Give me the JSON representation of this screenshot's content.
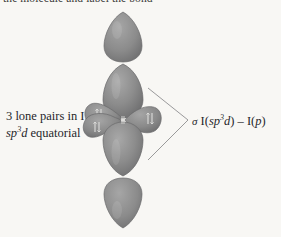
{
  "figure": {
    "name": "hybrid-orbital-diagram-iodine",
    "background_color": "#f8f7f4",
    "caption_top": "the molecule and label the bonds.",
    "labels": {
      "left_line1": "3 lone pairs in I",
      "left_line2_prefix": "sp",
      "left_line2_sup": "3",
      "left_line2_mid": "d",
      "left_line2_suffix": " equatorial",
      "right_sigma": "σ",
      "right_atom1": " I(",
      "right_hybrid_prefix": "sp",
      "right_hybrid_sup": "3",
      "right_hybrid_mid": "d",
      "right_close1": ") ",
      "right_dash": "–",
      "right_atom2": " I(",
      "right_porb": "p",
      "right_close2": ")"
    },
    "colors": {
      "lobe_fill": "#8c8c8c",
      "lobe_fill_light": "#9a9a9a",
      "lobe_fill_dark": "#6f6f70",
      "lobe_stroke": "#6a6a6b",
      "bracket_line": "#8f8f90",
      "text": "#26262a",
      "electron_mark": "#d8d8d6"
    },
    "geometry": {
      "center_x": 123,
      "center_y": 120,
      "axial_top_tip_y": 12,
      "axial_bottom_tip_y": 228,
      "bracket_apex_x": 188,
      "bracket_apex_y": 120,
      "bracket_top_x": 148,
      "bracket_top_y": 88,
      "bracket_bottom_x": 148,
      "bracket_bottom_y": 160
    },
    "orbital_lobes": [
      {
        "name": "axial-p-lobe-top-outer",
        "orientation": "up",
        "shape": "teardrop",
        "electrons": 0
      },
      {
        "name": "axial-hybrid-lobe-top",
        "orientation": "up",
        "shape": "ellipse",
        "electrons": 0
      },
      {
        "name": "equatorial-lobe-upper-left",
        "orientation": "upper-left",
        "shape": "lobe",
        "electrons": 2
      },
      {
        "name": "equatorial-lobe-lower-left",
        "orientation": "lower-left",
        "shape": "lobe",
        "electrons": 2
      },
      {
        "name": "equatorial-lobe-right",
        "orientation": "right",
        "shape": "lobe",
        "electrons": 2
      },
      {
        "name": "axial-hybrid-lobe-bottom",
        "orientation": "down",
        "shape": "ellipse",
        "electrons": 0
      },
      {
        "name": "axial-p-lobe-bottom-outer",
        "orientation": "down",
        "shape": "teardrop",
        "electrons": 0
      }
    ]
  }
}
